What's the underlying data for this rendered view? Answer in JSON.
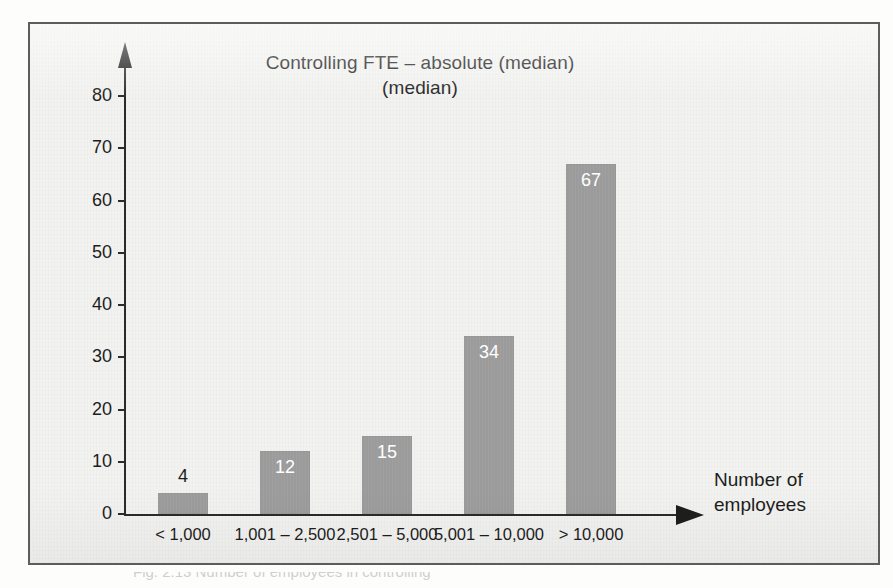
{
  "figure": {
    "title_line1": "Controlling FTE – absolute",
    "title_line2": "(median)",
    "caption": "Fig. 2.13   Number of employees in controlling",
    "frame_border_color": "#5d5d5d",
    "background_color": "#f2f2f0"
  },
  "chart_data": {
    "type": "bar",
    "title": "Controlling FTE – absolute (median)",
    "subtitle": "(median)",
    "xlabel": "Number of employees",
    "ylabel": "",
    "categories": [
      "< 1,000",
      "1,001 – 2,500",
      "2,501 – 5,000",
      "5,001 – 10,000",
      "> 10,000"
    ],
    "values": [
      4,
      12,
      15,
      34,
      67
    ],
    "value_labels": [
      "4",
      "12",
      "15",
      "34",
      "67"
    ],
    "value_label_placement": [
      "outside",
      "inside",
      "inside",
      "inside",
      "inside"
    ],
    "ylim": [
      0,
      85
    ],
    "yticks": [
      0,
      10,
      20,
      30,
      40,
      50,
      60,
      70,
      80
    ],
    "ytick_labels": [
      "0",
      "10",
      "20",
      "30",
      "40",
      "50",
      "60",
      "70",
      "80"
    ],
    "grid": false,
    "legend": false,
    "bar_color": "#9b9b9b",
    "axis_color": "#2b2b2b",
    "text_color": "#1d1d1d",
    "x_axis_arrow": true,
    "y_axis_arrow": true
  },
  "axis_title": {
    "line1": "Number of",
    "line2": "employees"
  }
}
